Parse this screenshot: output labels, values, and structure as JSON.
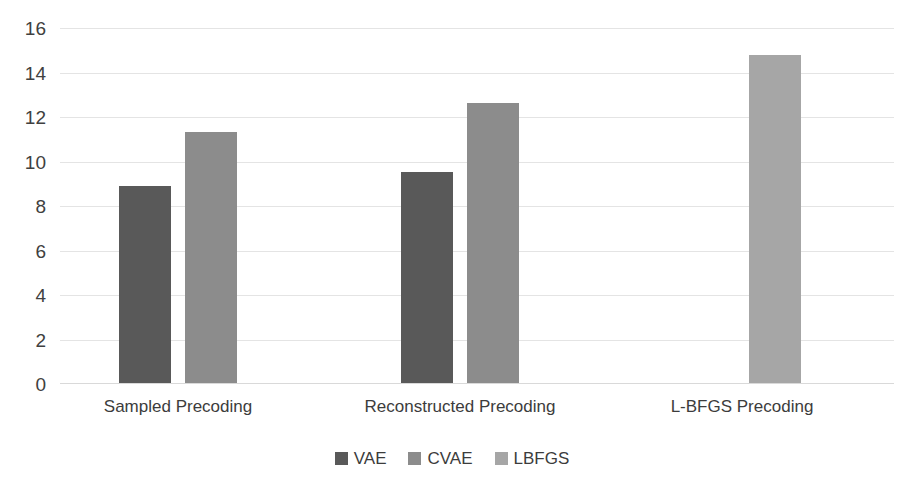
{
  "chart_data": {
    "type": "bar",
    "title": "",
    "subtitle": "",
    "xlabel": "",
    "ylabel": "",
    "ylim": [
      0,
      16
    ],
    "yticks": [
      0,
      2,
      4,
      6,
      8,
      10,
      12,
      14,
      16
    ],
    "ytick_labels": [
      "0",
      "2",
      "4",
      "6",
      "8",
      "10",
      "12",
      "14",
      "16"
    ],
    "grid": true,
    "legend_position": "bottom-center",
    "categories": [
      "Sampled Precoding",
      "Reconstructed Precoding",
      "L-BFGS Precoding"
    ],
    "series": [
      {
        "name": "VAE",
        "color": "#595959",
        "values": [
          8.9,
          9.5,
          null
        ]
      },
      {
        "name": "CVAE",
        "color": "#8c8c8c",
        "values": [
          11.3,
          12.6,
          null
        ]
      },
      {
        "name": "LBFGS",
        "color": "#a6a6a6",
        "values": [
          null,
          null,
          14.8
        ]
      }
    ]
  },
  "legend": {
    "items": [
      {
        "label": "VAE",
        "swatch_class": "vae"
      },
      {
        "label": "CVAE",
        "swatch_class": "cvae"
      },
      {
        "label": "LBFGS",
        "swatch_class": "lbfgs"
      }
    ]
  },
  "axis": {
    "y_ticks": [
      "16",
      "14",
      "12",
      "10",
      "8",
      "6",
      "4",
      "2",
      "0"
    ]
  },
  "categories": {
    "labels": [
      "Sampled Precoding",
      "Reconstructed Precoding",
      "L-BFGS Precoding"
    ]
  }
}
